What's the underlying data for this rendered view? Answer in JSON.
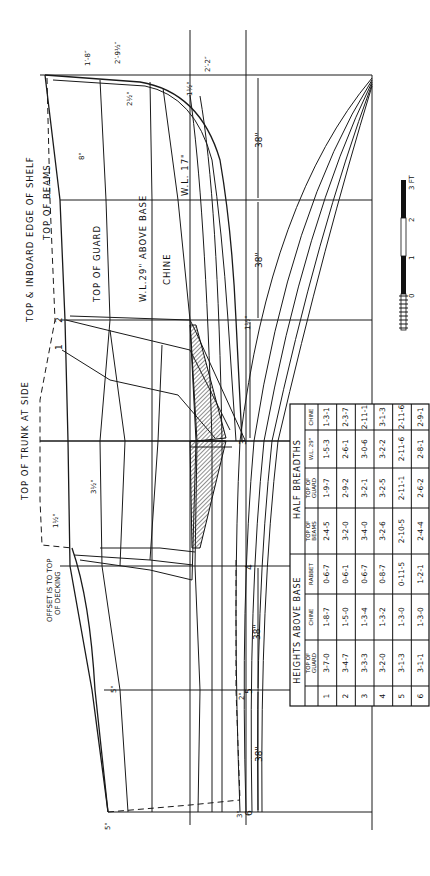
{
  "drawing": {
    "title_labels": {
      "top_of_trunk_at_side": "TOP OF TRUNK AT SIDE",
      "top_inboard_edge_of_shelf": "TOP & INBOARD  EDGE OF SHELF",
      "top_of_beams": "TOP OF BEAMS",
      "top_of_guard": "TOP OF GUARD",
      "wl_29_above_base": "W.L.29\" ABOVE BASE",
      "chine": "CHINE",
      "wl_17": "W.L. 17\"",
      "offset_note_line1": "OFFSET IS TO TOP",
      "offset_note_line2": "OF DECKING"
    },
    "stations": [
      "1",
      "2",
      "3",
      "4",
      "5",
      "6"
    ],
    "station_spacing_labels": [
      "38\"",
      "38\"",
      "38\"",
      "38\"",
      "38\"",
      "38\""
    ],
    "dimension_notes": {
      "bow_top_1": "1′-8″",
      "bow_top_2": "2′-9½″",
      "bow_top_3": "2′-2″",
      "bow_small_1": "1½\"",
      "bow_small_2": "2½\"",
      "beam_offset": "8\"",
      "trunk_offset": "3½\"",
      "trunk_gap": "2\"",
      "deck_offset": "1½\"",
      "stern_5": "5\"",
      "stern_3": "3\"",
      "stern_2": "2\"",
      "stern_5b": "5\"",
      "station3_note": "1½\"",
      "station2_note": "2½\""
    },
    "scale_bar": {
      "labels": [
        "0",
        "1",
        "2",
        "3 FT"
      ],
      "colors": {
        "dark": "#111111",
        "light": "#ffffff"
      }
    },
    "table": {
      "group_heights": "HEIGHTS ABOVE BASE",
      "group_breadths": "HALF BREADTHS",
      "columns": [
        "",
        "TOP OF GUARD",
        "CHINE",
        "RABBET",
        "TOP OF BEAMS",
        "TOP OF GUARD",
        "W.L. 29\"",
        "CHINE"
      ],
      "rows": [
        {
          "station": "1",
          "values": [
            "3-7-0",
            "1-8-7",
            "0-6-7",
            "2-4-5",
            "1-9-7",
            "1-5-3",
            "1-3-1"
          ]
        },
        {
          "station": "2",
          "values": [
            "3-4-7",
            "1-5-0",
            "0-6-1",
            "3-2-0",
            "2-9-2",
            "2-6-1",
            "2-3-7"
          ]
        },
        {
          "station": "3",
          "values": [
            "3-3-3",
            "1-3-4",
            "0-6-7",
            "3-4-0",
            "3-2-1",
            "3-0-6",
            "2-11-1"
          ]
        },
        {
          "station": "4",
          "values": [
            "3-2-0",
            "1-3-2",
            "0-8-7",
            "3-2-6",
            "3-2-5",
            "3-2-2",
            "3-1-3"
          ]
        },
        {
          "station": "5",
          "values": [
            "3-1-3",
            "1-3-0",
            "0-11-5",
            "2-10-5",
            "2-11-1",
            "2-11-6",
            "2-11-6"
          ]
        },
        {
          "station": "6",
          "values": [
            "3-1-1",
            "1-3-0",
            "1-2-1",
            "2-4-4",
            "2-6-2",
            "2-8-1",
            "2-9-1"
          ]
        }
      ]
    }
  }
}
